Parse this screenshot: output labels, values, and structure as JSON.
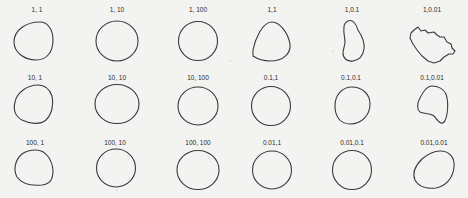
{
  "figure": {
    "background_color": "#f3f3f1",
    "stroke_color": "#3a3a3a",
    "rows": [
      {
        "cells": [
          {
            "label": "1, 1",
            "shape": "rounded-blob"
          },
          {
            "label": "1, 10",
            "shape": "circle"
          },
          {
            "label": "1, 100",
            "shape": "circle"
          },
          {
            "label": "1,1",
            "shape": "rounded-triangle"
          },
          {
            "label": "1,0.1",
            "shape": "kidney"
          },
          {
            "label": "1,0.01",
            "shape": "jagged-blob"
          }
        ]
      },
      {
        "cells": [
          {
            "label": "10, 1",
            "shape": "rounded-blob"
          },
          {
            "label": "10, 10",
            "shape": "ellipse"
          },
          {
            "label": "10, 100",
            "shape": "circle"
          },
          {
            "label": "0.1,1",
            "shape": "circle"
          },
          {
            "label": "0.1,0.1",
            "shape": "circle"
          },
          {
            "label": "0.1,0.01",
            "shape": "notched-blob"
          }
        ]
      },
      {
        "cells": [
          {
            "label": "100, 1",
            "shape": "rounded-blob"
          },
          {
            "label": "100, 10",
            "shape": "circle"
          },
          {
            "label": "100, 100",
            "shape": "circle"
          },
          {
            "label": "0.01,1",
            "shape": "circle"
          },
          {
            "label": "0.01,0.1",
            "shape": "circle"
          },
          {
            "label": "0.01,0.01",
            "shape": "tilted-ellipse"
          }
        ]
      }
    ]
  }
}
